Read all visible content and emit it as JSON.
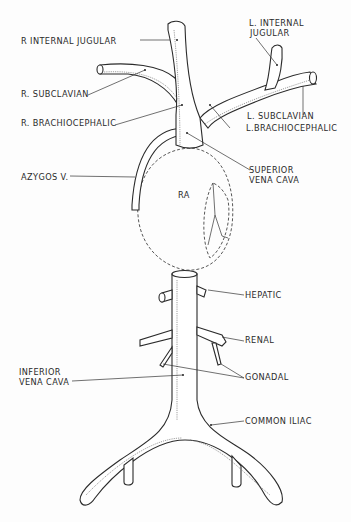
{
  "diagram": {
    "type": "anatomical line drawing",
    "labels": {
      "r_internal_jugular": "R INTERNAL JUGULAR",
      "l_internal_jugular_1": "L. INTERNAL",
      "l_internal_jugular_2": "JUGULAR",
      "r_subclavian": "R. SUBCLAVIAN",
      "l_subclavian": "L. SUBCLAVIAN",
      "r_brachiocephalic": "R. BRACHIOCEPHALIC",
      "l_brachiocephalic": "L.BRACHIOCEPHALIC",
      "azygos": "AZYGOS V.",
      "svc_1": "SUPERIOR",
      "svc_2": "VENA CAVA",
      "ra": "RA",
      "hepatic": "HEPATIC",
      "renal": "RENAL",
      "gonadal": "GONADAL",
      "ivc_1": "INFERIOR",
      "ivc_2": "VENA CAVA",
      "common_iliac": "COMMON ILIAC"
    },
    "colors": {
      "line": "#2b2b2b",
      "background": "#fdfdfd"
    }
  }
}
